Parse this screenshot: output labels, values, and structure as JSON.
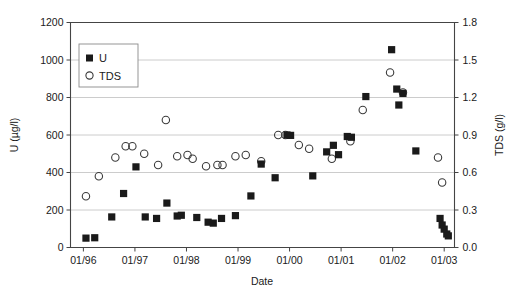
{
  "chart_data": {
    "type": "scatter",
    "title": "",
    "xlabel": "Date",
    "ylabel": "U (µg/l)",
    "y2label": "TDS (g/l)",
    "grid": true,
    "legend_position": "top-left",
    "x_tick_labels": [
      "01/96",
      "01/97",
      "01/98",
      "01/99",
      "01/00",
      "01/01",
      "01/02",
      "01/03"
    ],
    "x_tick_values": [
      1996.0,
      1997.0,
      1998.0,
      1999.0,
      2000.0,
      2001.0,
      2002.0,
      2003.0
    ],
    "xlim": [
      1995.75,
      2003.2
    ],
    "y_tick_labels": [
      "0",
      "200",
      "400",
      "600",
      "800",
      "1000",
      "1200"
    ],
    "y_tick_values": [
      0,
      200,
      400,
      600,
      800,
      1000,
      1200
    ],
    "ylim": [
      0,
      1200
    ],
    "y2_tick_labels": [
      "0.0",
      "0.3",
      "0.6",
      "0.9",
      "1.2",
      "1.5",
      "1.8"
    ],
    "y2_tick_values": [
      0.0,
      0.3,
      0.6,
      0.9,
      1.2,
      1.5,
      1.8
    ],
    "y2lim": [
      0.0,
      1.8
    ],
    "series": [
      {
        "name": "U",
        "marker": "filled-square",
        "color": "#1a1a1a",
        "axis": "left",
        "unit": "µg/l",
        "points": [
          {
            "x": 1996.05,
            "y": 50
          },
          {
            "x": 1996.22,
            "y": 52
          },
          {
            "x": 1996.55,
            "y": 163
          },
          {
            "x": 1996.78,
            "y": 288
          },
          {
            "x": 1997.02,
            "y": 430
          },
          {
            "x": 1997.2,
            "y": 163
          },
          {
            "x": 1997.42,
            "y": 155
          },
          {
            "x": 1997.62,
            "y": 237
          },
          {
            "x": 1997.82,
            "y": 168
          },
          {
            "x": 1997.9,
            "y": 172
          },
          {
            "x": 1998.2,
            "y": 160
          },
          {
            "x": 1998.42,
            "y": 135
          },
          {
            "x": 1998.52,
            "y": 130
          },
          {
            "x": 1998.68,
            "y": 155
          },
          {
            "x": 1998.95,
            "y": 170
          },
          {
            "x": 1999.25,
            "y": 275
          },
          {
            "x": 1999.45,
            "y": 445
          },
          {
            "x": 1999.72,
            "y": 372
          },
          {
            "x": 1999.95,
            "y": 600
          },
          {
            "x": 2000.02,
            "y": 598
          },
          {
            "x": 2000.45,
            "y": 382
          },
          {
            "x": 2000.72,
            "y": 510
          },
          {
            "x": 2000.85,
            "y": 545
          },
          {
            "x": 2000.95,
            "y": 495
          },
          {
            "x": 2001.12,
            "y": 592
          },
          {
            "x": 2001.2,
            "y": 588
          },
          {
            "x": 2001.48,
            "y": 805
          },
          {
            "x": 2001.98,
            "y": 1055
          },
          {
            "x": 2002.08,
            "y": 845
          },
          {
            "x": 2002.12,
            "y": 760
          },
          {
            "x": 2002.2,
            "y": 822
          },
          {
            "x": 2002.45,
            "y": 515
          },
          {
            "x": 2002.92,
            "y": 155
          },
          {
            "x": 2002.96,
            "y": 120
          },
          {
            "x": 2003.0,
            "y": 98
          },
          {
            "x": 2003.05,
            "y": 72
          },
          {
            "x": 2003.08,
            "y": 62
          }
        ]
      },
      {
        "name": "TDS",
        "marker": "open-circle",
        "color": "#3a3a3a",
        "axis": "right",
        "unit": "g/l",
        "points": [
          {
            "x": 1996.05,
            "y": 0.41
          },
          {
            "x": 1996.3,
            "y": 0.57
          },
          {
            "x": 1996.62,
            "y": 0.72
          },
          {
            "x": 1996.82,
            "y": 0.81
          },
          {
            "x": 1996.95,
            "y": 0.81
          },
          {
            "x": 1997.18,
            "y": 0.75
          },
          {
            "x": 1997.45,
            "y": 0.66
          },
          {
            "x": 1997.6,
            "y": 1.02
          },
          {
            "x": 1997.82,
            "y": 0.73
          },
          {
            "x": 1998.02,
            "y": 0.74
          },
          {
            "x": 1998.12,
            "y": 0.71
          },
          {
            "x": 1998.38,
            "y": 0.65
          },
          {
            "x": 1998.6,
            "y": 0.66
          },
          {
            "x": 1998.7,
            "y": 0.66
          },
          {
            "x": 1998.95,
            "y": 0.73
          },
          {
            "x": 1999.15,
            "y": 0.74
          },
          {
            "x": 1999.45,
            "y": 0.69
          },
          {
            "x": 1999.78,
            "y": 0.9
          },
          {
            "x": 1999.92,
            "y": 0.9
          },
          {
            "x": 2000.18,
            "y": 0.82
          },
          {
            "x": 2000.38,
            "y": 0.79
          },
          {
            "x": 2000.82,
            "y": 0.71
          },
          {
            "x": 2001.18,
            "y": 0.85
          },
          {
            "x": 2001.42,
            "y": 1.1
          },
          {
            "x": 2001.95,
            "y": 1.4
          },
          {
            "x": 2002.2,
            "y": 1.24
          },
          {
            "x": 2002.88,
            "y": 0.72
          },
          {
            "x": 2002.96,
            "y": 0.52
          }
        ]
      }
    ],
    "legend": [
      {
        "label": "U",
        "marker": "filled-square"
      },
      {
        "label": "TDS",
        "marker": "open-circle"
      }
    ]
  }
}
